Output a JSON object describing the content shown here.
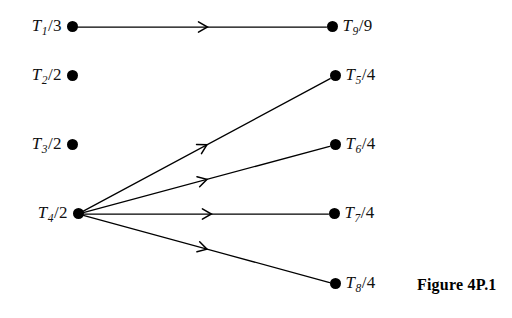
{
  "figure": {
    "caption": "Figure 4P.1",
    "caption_pos": {
      "x": 417,
      "y": 277
    },
    "width": 512,
    "height": 318,
    "background_color": "#ffffff",
    "ink_color": "#000000"
  },
  "diagram": {
    "type": "directed-graph",
    "node_radius": 5.5,
    "nodes": [
      {
        "id": "T1",
        "label": "T1/3",
        "var": "T",
        "sub": "1",
        "slash": "/",
        "num": "3",
        "column": "left",
        "dot": {
          "x": 72,
          "y": 27
        }
      },
      {
        "id": "T2",
        "label": "T2/2",
        "var": "T",
        "sub": "2",
        "slash": "/",
        "num": "2",
        "column": "left",
        "dot": {
          "x": 72,
          "y": 76
        }
      },
      {
        "id": "T3",
        "label": "T3/2",
        "var": "T",
        "sub": "3",
        "slash": "/",
        "num": "2",
        "column": "left",
        "dot": {
          "x": 72,
          "y": 145
        }
      },
      {
        "id": "T4",
        "label": "T4/2",
        "var": "T",
        "sub": "4",
        "slash": "/",
        "num": "2",
        "column": "left",
        "dot": {
          "x": 78,
          "y": 214
        }
      },
      {
        "id": "T9",
        "label": "T9/9",
        "var": "T",
        "sub": "9",
        "slash": "/",
        "num": "9",
        "column": "right",
        "dot": {
          "x": 332,
          "y": 27
        }
      },
      {
        "id": "T5",
        "label": "T5/4",
        "var": "T",
        "sub": "5",
        "slash": "/",
        "num": "4",
        "column": "right",
        "dot": {
          "x": 335,
          "y": 76
        }
      },
      {
        "id": "T6",
        "label": "T6/4",
        "var": "T",
        "sub": "6",
        "slash": "/",
        "num": "4",
        "column": "right",
        "dot": {
          "x": 335,
          "y": 145
        }
      },
      {
        "id": "T7",
        "label": "T7/4",
        "var": "T",
        "sub": "7",
        "slash": "/",
        "num": "4",
        "column": "right",
        "dot": {
          "x": 334,
          "y": 214
        }
      },
      {
        "id": "T8",
        "label": "T8/4",
        "var": "T",
        "sub": "8",
        "slash": "/",
        "num": "4",
        "column": "right",
        "dot": {
          "x": 335,
          "y": 284
        }
      }
    ],
    "edges": [
      {
        "id": "T1-T9",
        "from": "T1",
        "to": "T9",
        "arrow_at": 0.52
      },
      {
        "id": "T4-T5",
        "from": "T4",
        "to": "T5",
        "arrow_at": 0.5
      },
      {
        "id": "T4-T6",
        "from": "T4",
        "to": "T6",
        "arrow_at": 0.5
      },
      {
        "id": "T4-T7",
        "from": "T4",
        "to": "T7",
        "arrow_at": 0.52
      },
      {
        "id": "T4-T8",
        "from": "T4",
        "to": "T8",
        "arrow_at": 0.5
      }
    ]
  }
}
